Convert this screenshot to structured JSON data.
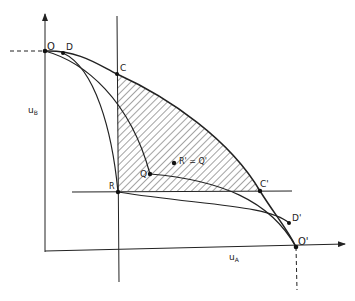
{
  "diagram": {
    "type": "utility-possibility-frontier (Edgeworth-style) diagram",
    "axes": {
      "x_label": "u",
      "x_sub": "A",
      "y_label": "u",
      "y_sub": "B"
    },
    "points": {
      "O": "O",
      "D": "D",
      "C": "C",
      "R": "R",
      "Q": "Q",
      "R_prime_eq_Q_prime": "R' = Q'",
      "C_prime": "C'",
      "D_prime": "D'",
      "O_prime": "O'"
    },
    "colors": {
      "ink": "#222222",
      "background": "#ffffff"
    }
  }
}
